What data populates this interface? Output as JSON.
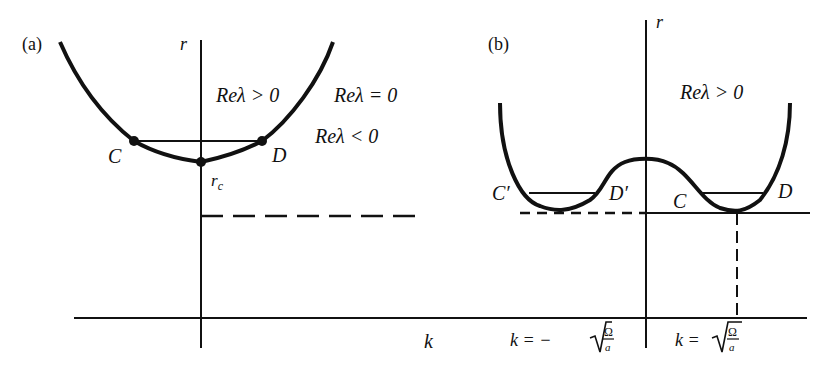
{
  "figure": {
    "panel_a": {
      "label": "(a)",
      "axis_r": "r",
      "region_above": "Reλ > 0",
      "region_boundary": "Reλ = 0",
      "region_below": "Reλ < 0",
      "point_left": "C",
      "point_right": "D",
      "critical_label": "r",
      "critical_sub": "c"
    },
    "panel_b": {
      "label": "(b)",
      "axis_r": "r",
      "region_above": "Reλ > 0",
      "point_left_outer": "C′",
      "point_left_inner": "D′",
      "point_right_inner": "C",
      "point_right_outer": "D"
    },
    "k_axis": {
      "label": "k",
      "neg_root_prefix": "k = −",
      "pos_root_prefix": "k = ",
      "root_num": "Ω",
      "root_den": "a"
    }
  }
}
